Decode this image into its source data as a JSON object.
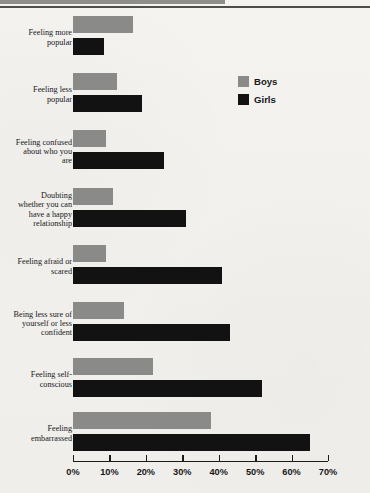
{
  "chart_data": {
    "type": "bar",
    "orientation": "horizontal",
    "title": "",
    "xlabel": "",
    "ylabel": "",
    "xlim": [
      0,
      70
    ],
    "xunit": "%",
    "grid": false,
    "legend_position": "upper-right",
    "tick_labels": [
      "0%",
      "10%",
      "20%",
      "30%",
      "40%",
      "50%",
      "60%",
      "70%"
    ],
    "tick_values": [
      0,
      10,
      20,
      30,
      40,
      50,
      60,
      70
    ],
    "categories": [
      "Feeling more popular",
      "Feeling less popular",
      "Feeling confused about who you are",
      "Doubting whether you can have a happy relationship",
      "Feeling afraid or scared",
      "Being less sure of yourself or less confident",
      "Feeling self-conscious",
      "Feeling embarrassed"
    ],
    "series": [
      {
        "name": "Boys",
        "color": "#8a8a88",
        "values": [
          16.5,
          12,
          9,
          11,
          9,
          14,
          22,
          38
        ]
      },
      {
        "name": "Girls",
        "color": "#121212",
        "values": [
          8.5,
          19,
          25,
          31,
          41,
          43,
          52,
          65
        ]
      }
    ]
  },
  "legend": {
    "items": [
      {
        "label": "Boys",
        "color": "#8a8a88"
      },
      {
        "label": "Girls",
        "color": "#121212"
      }
    ]
  },
  "categories_display": [
    "Feeling more\npopular",
    "Feeling less\npopular",
    "Feeling confused\nabout who you\nare",
    "Doubting\nwhether you can\nhave a happy\nrelationship",
    "Feeling afraid or\nscared",
    "Being less sure of\nyourself or less\nconfident",
    "Feeling self-\nconscious",
    "Feeling\nembarrassed"
  ]
}
